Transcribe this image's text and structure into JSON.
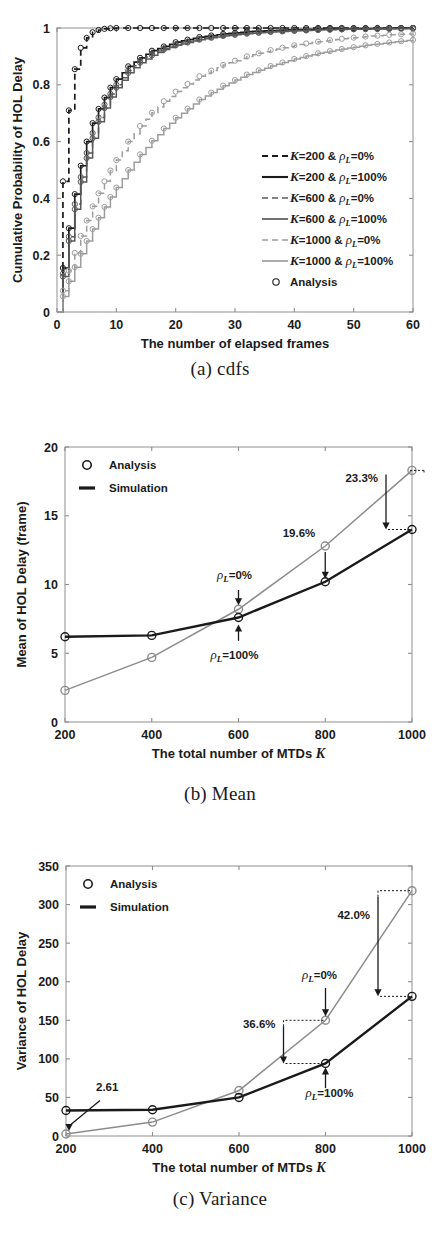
{
  "figure_a": {
    "caption": "(a) cdfs",
    "xlabel": "The number of elapsed frames",
    "ylabel": "Cumulative Probability of HOL Delay",
    "xticks": [
      "0",
      "10",
      "20",
      "30",
      "40",
      "50",
      "60"
    ],
    "yticks": [
      "0",
      "0.2",
      "0.4",
      "0.6",
      "0.8",
      "1"
    ],
    "legend": [
      {
        "label_k": "K=200 & ",
        "label_rho": "ρ",
        "label_sub": "L",
        "label_val": "=0%",
        "style": "dashed",
        "color": "#1a1a1a"
      },
      {
        "label_k": "K=200 & ",
        "label_rho": "ρ",
        "label_sub": "L",
        "label_val": "=100%",
        "style": "solid",
        "color": "#1a1a1a"
      },
      {
        "label_k": "K=600 & ",
        "label_rho": "ρ",
        "label_sub": "L",
        "label_val": "=0%",
        "style": "dashed",
        "color": "#595959"
      },
      {
        "label_k": "K=600 & ",
        "label_rho": "ρ",
        "label_sub": "L",
        "label_val": "=100%",
        "style": "solid",
        "color": "#595959"
      },
      {
        "label_k": "K=1000 & ",
        "label_rho": "ρ",
        "label_sub": "L",
        "label_val": "=0%",
        "style": "dashed",
        "color": "#9d9d9d"
      },
      {
        "label_k": "K=1000 & ",
        "label_rho": "ρ",
        "label_sub": "L",
        "label_val": "=100%",
        "style": "solid",
        "color": "#9d9d9d"
      },
      {
        "label_k": "Analysis",
        "label_rho": "",
        "label_sub": "",
        "label_val": "",
        "style": "circle",
        "color": "#1a1a1a"
      }
    ]
  },
  "figure_b": {
    "caption": "(b) Mean",
    "xlabel": "The total number of MTDs K",
    "ylabel": "Mean of HOL Delay (frame)",
    "xticks": [
      "200",
      "400",
      "600",
      "800",
      "1000"
    ],
    "yticks": [
      "0",
      "5",
      "10",
      "15",
      "20"
    ],
    "legend": [
      {
        "label": "Analysis",
        "marker": "circle"
      },
      {
        "label": "Simulation",
        "marker": "line"
      }
    ],
    "annotations": [
      {
        "text": "23.3%"
      },
      {
        "text": "19.6%"
      },
      {
        "text": "=0%",
        "rho": "ρ",
        "sub": "L"
      },
      {
        "text": "=100%",
        "rho": "ρ",
        "sub": "L"
      }
    ]
  },
  "figure_c": {
    "caption": "(c) Variance",
    "xlabel": "The total number of MTDs K",
    "ylabel": "Variance of HOL Delay",
    "xticks": [
      "200",
      "400",
      "600",
      "800",
      "1000"
    ],
    "yticks": [
      "0",
      "50",
      "100",
      "150",
      "200",
      "250",
      "300",
      "350"
    ],
    "legend": [
      {
        "label": "Analysis",
        "marker": "circle"
      },
      {
        "label": "Simulation",
        "marker": "line"
      }
    ],
    "annotations": [
      {
        "text": "42.0%"
      },
      {
        "text": "36.6%"
      },
      {
        "text": "2.61"
      },
      {
        "text": "=0%",
        "rho": "ρ",
        "sub": "L"
      },
      {
        "text": "=100%",
        "rho": "ρ",
        "sub": "L"
      }
    ]
  },
  "colors": {
    "dark": "#1a1a1a",
    "mid": "#595959",
    "light": "#9d9d9d",
    "frame": "#9a9a9a"
  },
  "chart_data": [
    {
      "id": "a",
      "type": "line",
      "title": "",
      "subtitle": "(a) cdfs",
      "xlabel": "The number of elapsed frames",
      "ylabel": "Cumulative Probability of HOL Delay",
      "xlim": [
        0,
        60
      ],
      "ylim": [
        0,
        1
      ],
      "xticks": [
        0,
        10,
        20,
        30,
        40,
        50,
        60
      ],
      "yticks": [
        0,
        0.2,
        0.4,
        0.6,
        0.8,
        1
      ],
      "grid": false,
      "legend_position": "center-right",
      "legend": [
        "K=200 & ρ_L=0%",
        "K=200 & ρ_L=100%",
        "K=600 & ρ_L=0%",
        "K=600 & ρ_L=100%",
        "K=1000 & ρ_L=0%",
        "K=1000 & ρ_L=100%",
        "Analysis"
      ],
      "x": [
        1,
        2,
        3,
        4,
        5,
        6,
        7,
        8,
        9,
        10,
        12,
        14,
        16,
        18,
        20,
        24,
        28,
        32,
        36,
        40,
        44,
        48,
        52,
        56,
        60
      ],
      "series": [
        {
          "name": "K=200 & ρ_L=0%",
          "style": "dashed",
          "color": "#1a1a1a",
          "values": [
            0.46,
            0.71,
            0.855,
            0.93,
            0.965,
            0.985,
            0.993,
            0.997,
            0.999,
            1.0,
            1.0,
            1.0,
            1.0,
            1.0,
            1.0,
            1.0,
            1.0,
            1.0,
            1.0,
            1.0,
            1.0,
            1.0,
            1.0,
            1.0,
            1.0
          ]
        },
        {
          "name": "K=200 & ρ_L=100%",
          "style": "solid",
          "color": "#1a1a1a",
          "values": [
            0.155,
            0.295,
            0.415,
            0.515,
            0.6,
            0.665,
            0.715,
            0.755,
            0.79,
            0.82,
            0.865,
            0.895,
            0.92,
            0.935,
            0.95,
            0.968,
            0.979,
            0.987,
            0.991,
            0.994,
            0.996,
            0.997,
            0.998,
            0.999,
            1.0
          ]
        },
        {
          "name": "K=600 & ρ_L=0%",
          "style": "dashed",
          "color": "#595959",
          "values": [
            0.135,
            0.265,
            0.38,
            0.475,
            0.56,
            0.63,
            0.685,
            0.73,
            0.768,
            0.8,
            0.85,
            0.885,
            0.91,
            0.928,
            0.942,
            0.962,
            0.974,
            0.982,
            0.988,
            0.991,
            0.994,
            0.996,
            0.997,
            0.998,
            0.999
          ]
        },
        {
          "name": "K=600 & ρ_L=100%",
          "style": "solid",
          "color": "#595959",
          "values": [
            0.125,
            0.25,
            0.362,
            0.458,
            0.542,
            0.612,
            0.67,
            0.718,
            0.757,
            0.79,
            0.842,
            0.878,
            0.904,
            0.924,
            0.939,
            0.959,
            0.972,
            0.98,
            0.986,
            0.99,
            0.993,
            0.995,
            0.996,
            0.997,
            0.998
          ]
        },
        {
          "name": "K=1000 & ρ_L=0%",
          "style": "dashed",
          "color": "#9d9d9d",
          "values": [
            0.075,
            0.145,
            0.208,
            0.268,
            0.322,
            0.372,
            0.418,
            0.46,
            0.498,
            0.535,
            0.6,
            0.655,
            0.702,
            0.742,
            0.776,
            0.83,
            0.87,
            0.9,
            0.922,
            0.939,
            0.952,
            0.962,
            0.97,
            0.976,
            0.98
          ]
        },
        {
          "name": "K=1000 & ρ_L=100%",
          "style": "solid",
          "color": "#9d9d9d",
          "values": [
            0.055,
            0.108,
            0.158,
            0.205,
            0.25,
            0.292,
            0.332,
            0.37,
            0.405,
            0.438,
            0.5,
            0.555,
            0.603,
            0.646,
            0.684,
            0.748,
            0.797,
            0.836,
            0.866,
            0.891,
            0.911,
            0.926,
            0.939,
            0.949,
            0.958
          ]
        }
      ]
    },
    {
      "id": "b",
      "type": "line",
      "title": "",
      "subtitle": "(b) Mean",
      "xlabel": "The total number of MTDs K",
      "ylabel": "Mean of HOL Delay (frame)",
      "xlim": [
        200,
        1000
      ],
      "ylim": [
        0,
        20
      ],
      "xticks": [
        200,
        400,
        600,
        800,
        1000
      ],
      "yticks": [
        0,
        5,
        10,
        15,
        20
      ],
      "grid": false,
      "legend_position": "top-left",
      "legend": [
        "Analysis",
        "Simulation"
      ],
      "categories": [
        200,
        400,
        600,
        800,
        1000
      ],
      "series": [
        {
          "name": "ρ_L=100% (Simulation)",
          "color": "#1a1a1a",
          "values": [
            6.2,
            6.3,
            7.6,
            10.2,
            14.0
          ]
        },
        {
          "name": "ρ_L=0% (Simulation)",
          "color": "#8c8c8c",
          "values": [
            2.3,
            4.7,
            8.2,
            12.8,
            18.3
          ]
        }
      ],
      "annotations": [
        {
          "text": "23.3%",
          "at_x": 1000,
          "from_y": 18.3,
          "to_y": 14.0
        },
        {
          "text": "19.6%",
          "at_x": 800,
          "from_y": 12.8,
          "to_y": 10.2
        },
        {
          "text": "ρ_L=0%",
          "at_x": 600,
          "points_to_y": 8.2
        },
        {
          "text": "ρ_L=100%",
          "at_x": 600,
          "points_to_y": 7.6
        }
      ]
    },
    {
      "id": "c",
      "type": "line",
      "title": "",
      "subtitle": "(c) Variance",
      "xlabel": "The total number of MTDs K",
      "ylabel": "Variance of HOL Delay",
      "xlim": [
        200,
        1000
      ],
      "ylim": [
        0,
        350
      ],
      "xticks": [
        200,
        400,
        600,
        800,
        1000
      ],
      "yticks": [
        0,
        50,
        100,
        150,
        200,
        250,
        300,
        350
      ],
      "grid": false,
      "legend_position": "top-left",
      "legend": [
        "Analysis",
        "Simulation"
      ],
      "categories": [
        200,
        400,
        600,
        800,
        1000
      ],
      "series": [
        {
          "name": "ρ_L=100% (Simulation)",
          "color": "#1a1a1a",
          "values": [
            33,
            34,
            50,
            94,
            181
          ]
        },
        {
          "name": "ρ_L=0% (Simulation)",
          "color": "#8c8c8c",
          "values": [
            2.61,
            18,
            59,
            150,
            318
          ]
        }
      ],
      "annotations": [
        {
          "text": "42.0%",
          "at_x": 1000,
          "from_y": 318,
          "to_y": 181
        },
        {
          "text": "36.6%",
          "at_x": 800,
          "from_y": 150,
          "to_y": 94
        },
        {
          "text": "2.61",
          "at_x": 200,
          "points_to_y": 2.61
        },
        {
          "text": "ρ_L=0%",
          "at_x": 800,
          "points_to_y": 150
        },
        {
          "text": "ρ_L=100%",
          "at_x": 800,
          "points_to_y": 94
        }
      ]
    }
  ]
}
